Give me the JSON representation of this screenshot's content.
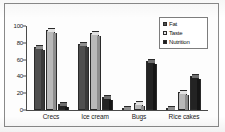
{
  "chart_data": {
    "type": "bar",
    "title": "",
    "xlabel": "",
    "ylabel": "",
    "ylim": [
      0,
      100
    ],
    "yticks": [
      "0",
      "20",
      "40",
      "60",
      "80",
      "100"
    ],
    "grid": false,
    "legend_position": "top-right",
    "categories": [
      "Crecs",
      "Ice cream",
      "Bugs",
      "Rice cakes"
    ],
    "series": [
      {
        "name": "Fat",
        "color": "#4f4f4f",
        "values": [
          75,
          78,
          2,
          2
        ]
      },
      {
        "name": "Taste",
        "color": "#b9b9b9",
        "values": [
          95,
          92,
          8,
          22
        ]
      },
      {
        "name": "Nutrition",
        "color": "#232323",
        "values": [
          7,
          15,
          58,
          40
        ]
      }
    ]
  },
  "legend": {
    "items": [
      {
        "label": "Fat",
        "swatch": "fat"
      },
      {
        "label": "Taste",
        "swatch": "taste"
      },
      {
        "label": "Nutrition",
        "swatch": "nutrition"
      }
    ]
  }
}
